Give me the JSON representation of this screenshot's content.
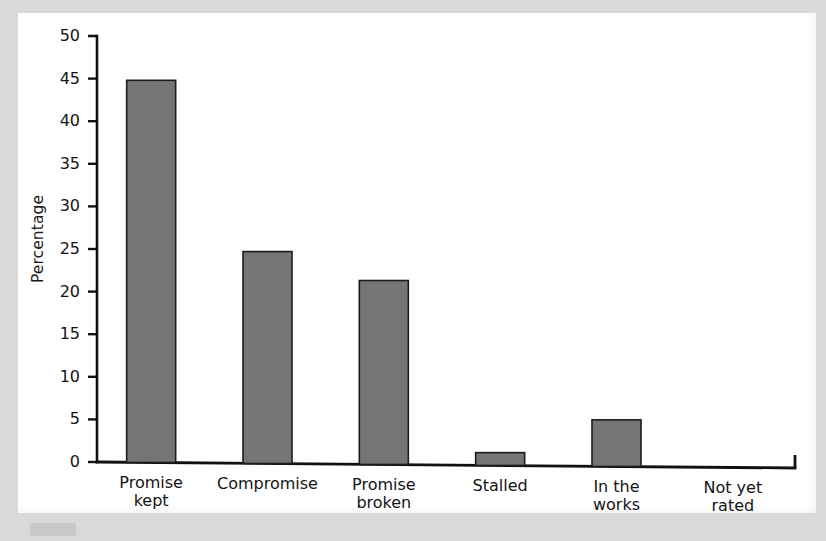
{
  "chart_data": {
    "type": "bar",
    "title": "",
    "subtitle": "",
    "xlabel": "",
    "ylabel": "Percentage",
    "categories": [
      "Promise kept",
      "Compromise",
      "Promise broken",
      "Stalled",
      "In the works",
      "Not yet rated"
    ],
    "category_lines": [
      [
        "Promise",
        "kept"
      ],
      [
        "Compromise",
        ""
      ],
      [
        "Promise",
        "broken"
      ],
      [
        "Stalled",
        ""
      ],
      [
        "In the",
        "works"
      ],
      [
        "Not yet",
        "rated"
      ]
    ],
    "values": [
      44.8,
      24.7,
      21.3,
      1.1,
      4.95,
      0
    ],
    "ylim": [
      0,
      50
    ],
    "yticks": [
      0,
      5,
      10,
      15,
      20,
      25,
      30,
      35,
      40,
      45,
      50
    ],
    "ytick_labels": [
      "0",
      "5",
      "10",
      "15",
      "20",
      "25",
      "30",
      "35",
      "40",
      "45",
      "50"
    ],
    "grid": false,
    "legend": null,
    "bar_color": "#757575",
    "bar_edge_color": "#1c1c1c",
    "axis_color": "#111111",
    "background_color": "#ffffff"
  },
  "page": {
    "sheet_color": "#ffffff",
    "margin_color": "#d9d9d9"
  }
}
